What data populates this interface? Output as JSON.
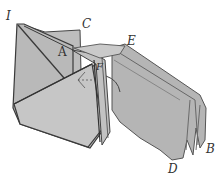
{
  "figure": {
    "colors": {
      "paper_fill": "#b8b8b8",
      "paper_light": "#cfcfcf",
      "paper_dark": "#9a9a9a",
      "ink": "#3a3a3a",
      "background": "#ffffff"
    },
    "labels": [
      {
        "id": "I",
        "text": "I",
        "x": 6,
        "y": 10
      },
      {
        "id": "C",
        "text": "C",
        "x": 82,
        "y": 18
      },
      {
        "id": "A",
        "text": "A",
        "x": 58,
        "y": 46
      },
      {
        "id": "E",
        "text": "E",
        "x": 127,
        "y": 35
      },
      {
        "id": "F",
        "text": "F",
        "x": 96,
        "y": 62
      },
      {
        "id": "D",
        "text": "D",
        "x": 168,
        "y": 163
      },
      {
        "id": "B",
        "text": "B",
        "x": 206,
        "y": 143
      }
    ]
  }
}
